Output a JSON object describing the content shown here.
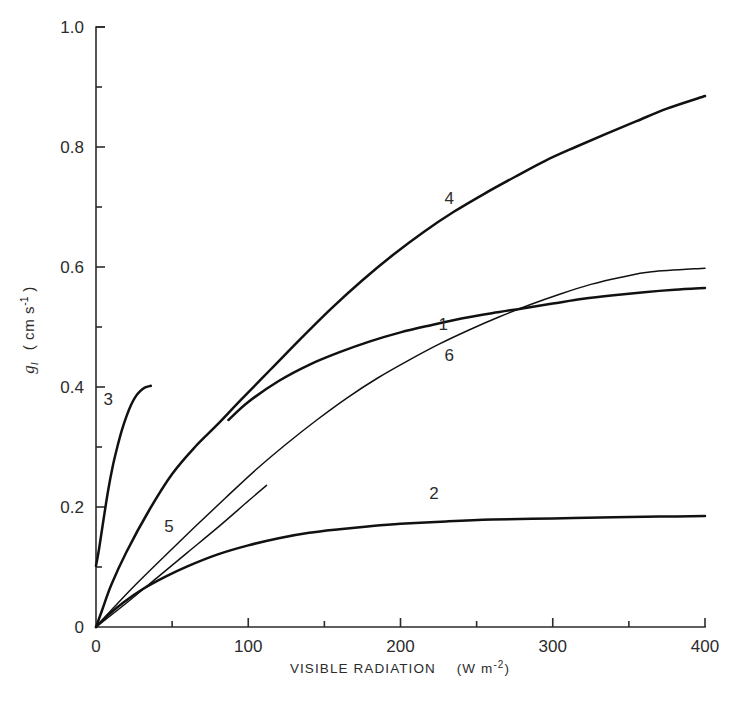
{
  "chart_data": {
    "type": "line",
    "title": "",
    "xlabel": "VISIBLE RADIATION  (W m-2)",
    "xlabel_text": "VISIBLE RADIATION",
    "xlabel_unit_open": "(W m",
    "xlabel_unit_exp": "-2",
    "xlabel_unit_close": ")",
    "ylabel_symbol": "g",
    "ylabel_subscript": "l",
    "ylabel_unit_open": "( cm s",
    "ylabel_unit_exp": "-1",
    "ylabel_unit_close": " )",
    "xlim": [
      0,
      400
    ],
    "ylim": [
      0,
      1.0
    ],
    "xticks": [
      0,
      100,
      200,
      300,
      400
    ],
    "xtick_labels": [
      "0",
      "100",
      "200",
      "300",
      "400"
    ],
    "xminor_ticks": [
      50,
      150,
      250,
      350
    ],
    "yticks": [
      0,
      0.2,
      0.4,
      0.6,
      0.8,
      1.0
    ],
    "ytick_labels": [
      "0",
      "0.2",
      "0.4",
      "0.6",
      "0.8",
      "1.0"
    ],
    "yminor_ticks": [
      0.1,
      0.3,
      0.5,
      0.7,
      0.9
    ],
    "grid": false,
    "legend": "inline curve numbers",
    "series": [
      {
        "name": "1",
        "label": "1",
        "label_x": 228,
        "label_y": 0.495,
        "linewidth": "thick",
        "points": [
          [
            87,
            0.345
          ],
          [
            100,
            0.375
          ],
          [
            120,
            0.41
          ],
          [
            140,
            0.437
          ],
          [
            160,
            0.458
          ],
          [
            180,
            0.476
          ],
          [
            200,
            0.491
          ],
          [
            220,
            0.503
          ],
          [
            240,
            0.514
          ],
          [
            260,
            0.523
          ],
          [
            280,
            0.531
          ],
          [
            300,
            0.539
          ],
          [
            320,
            0.547
          ],
          [
            340,
            0.553
          ],
          [
            360,
            0.558
          ],
          [
            380,
            0.562
          ],
          [
            400,
            0.565
          ]
        ]
      },
      {
        "name": "2",
        "label": "2",
        "label_x": 222,
        "label_y": 0.213,
        "linewidth": "thick",
        "points": [
          [
            0,
            0.0
          ],
          [
            8,
            0.02
          ],
          [
            18,
            0.041
          ],
          [
            30,
            0.062
          ],
          [
            45,
            0.083
          ],
          [
            60,
            0.101
          ],
          [
            80,
            0.121
          ],
          [
            100,
            0.136
          ],
          [
            120,
            0.148
          ],
          [
            140,
            0.157
          ],
          [
            160,
            0.163
          ],
          [
            180,
            0.168
          ],
          [
            200,
            0.172
          ],
          [
            230,
            0.176
          ],
          [
            260,
            0.179
          ],
          [
            300,
            0.181
          ],
          [
            340,
            0.183
          ],
          [
            370,
            0.184
          ],
          [
            400,
            0.185
          ]
        ]
      },
      {
        "name": "3",
        "label": "3",
        "label_x": 8,
        "label_y": 0.37,
        "linewidth": "thick",
        "points": [
          [
            0,
            0.102
          ],
          [
            2,
            0.13
          ],
          [
            5,
            0.18
          ],
          [
            8,
            0.228
          ],
          [
            11,
            0.268
          ],
          [
            14,
            0.3
          ],
          [
            17,
            0.328
          ],
          [
            20,
            0.351
          ],
          [
            23,
            0.37
          ],
          [
            26,
            0.384
          ],
          [
            29,
            0.393
          ],
          [
            32,
            0.399
          ],
          [
            36,
            0.402
          ]
        ]
      },
      {
        "name": "4",
        "label": "4",
        "label_x": 232,
        "label_y": 0.705,
        "linewidth": "thick",
        "points": [
          [
            0,
            0.0
          ],
          [
            4,
            0.028
          ],
          [
            10,
            0.07
          ],
          [
            20,
            0.125
          ],
          [
            35,
            0.195
          ],
          [
            50,
            0.255
          ],
          [
            65,
            0.3
          ],
          [
            80,
            0.338
          ],
          [
            95,
            0.378
          ],
          [
            115,
            0.43
          ],
          [
            135,
            0.482
          ],
          [
            155,
            0.532
          ],
          [
            175,
            0.578
          ],
          [
            195,
            0.62
          ],
          [
            215,
            0.658
          ],
          [
            235,
            0.692
          ],
          [
            255,
            0.722
          ],
          [
            275,
            0.75
          ],
          [
            295,
            0.777
          ],
          [
            315,
            0.8
          ],
          [
            335,
            0.822
          ],
          [
            355,
            0.843
          ],
          [
            375,
            0.864
          ],
          [
            400,
            0.885
          ]
        ]
      },
      {
        "name": "5",
        "label": "5",
        "label_x": 48,
        "label_y": 0.158,
        "linewidth": "thin",
        "points": [
          [
            0,
            0.0
          ],
          [
            20,
            0.04
          ],
          [
            40,
            0.082
          ],
          [
            60,
            0.124
          ],
          [
            80,
            0.166
          ],
          [
            100,
            0.21
          ],
          [
            112,
            0.236
          ]
        ]
      },
      {
        "name": "6",
        "label": "6",
        "label_x": 232,
        "label_y": 0.443,
        "linewidth": "thin",
        "points": [
          [
            0,
            0.0
          ],
          [
            10,
            0.028
          ],
          [
            25,
            0.068
          ],
          [
            45,
            0.118
          ],
          [
            65,
            0.167
          ],
          [
            85,
            0.215
          ],
          [
            105,
            0.262
          ],
          [
            125,
            0.305
          ],
          [
            145,
            0.345
          ],
          [
            165,
            0.382
          ],
          [
            185,
            0.415
          ],
          [
            205,
            0.444
          ],
          [
            225,
            0.471
          ],
          [
            245,
            0.495
          ],
          [
            265,
            0.517
          ],
          [
            285,
            0.537
          ],
          [
            305,
            0.555
          ],
          [
            325,
            0.571
          ],
          [
            345,
            0.583
          ],
          [
            365,
            0.592
          ],
          [
            400,
            0.598
          ]
        ]
      }
    ]
  }
}
